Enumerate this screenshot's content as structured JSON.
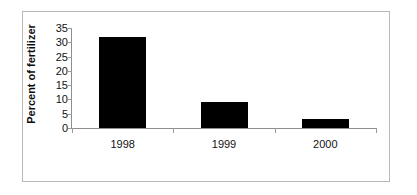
{
  "chart_data": {
    "type": "bar",
    "title": "",
    "subtitle": "",
    "xlabel": "",
    "ylabel": "Percent of fertilizer",
    "categories": [
      "1998",
      "1999",
      "2000"
    ],
    "values": [
      32,
      9,
      3
    ],
    "series": [
      {
        "name": "Percent of fertilizer",
        "values": [
          32,
          9,
          3
        ],
        "color": "#000000"
      }
    ],
    "ylim": [
      0,
      35
    ],
    "yticks": [
      0,
      5,
      10,
      15,
      20,
      25,
      30,
      35
    ],
    "ytick_labels": [
      "0",
      "5",
      "10",
      "15",
      "20",
      "25",
      "30",
      "35"
    ],
    "grid": false,
    "legend": false,
    "legend_position": "none",
    "annotations": [],
    "bar_color": "#000000",
    "axis_color": "#8d8d8d",
    "frame_color": "#b9b9b9",
    "background": "#ffffff"
  },
  "figure": {
    "border_present": true
  }
}
